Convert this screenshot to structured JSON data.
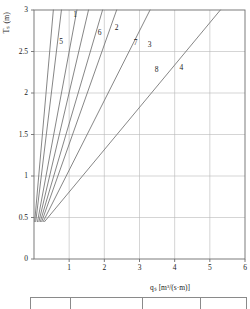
{
  "chart_data": {
    "type": "line",
    "title": "",
    "xlabel": "qₛ [m³/(s·m)]",
    "ylabel": "Tₛ (m)",
    "xlim": [
      0,
      6
    ],
    "ylim": [
      0,
      3
    ],
    "xticks": [
      "1",
      "2",
      "3",
      "4",
      "5",
      "6"
    ],
    "yticks": [
      "0",
      "0.5",
      "1",
      "1.5",
      "2",
      "2.5",
      "3"
    ],
    "grid": true,
    "legend": "inline-curve-labels",
    "series": [
      {
        "name": "5",
        "label": "5",
        "label_x": 0.8,
        "label_y": 2.62,
        "x": [
          0.02,
          0.55
        ],
        "y": [
          0.45,
          3.0
        ]
      },
      {
        "name": "1",
        "label": "1",
        "label_x": 1.2,
        "label_y": 2.94,
        "x": [
          0.05,
          0.78
        ],
        "y": [
          0.45,
          3.0
        ]
      },
      {
        "name": "6",
        "label": "6",
        "label_x": 1.9,
        "label_y": 2.72,
        "x": [
          0.1,
          1.22
        ],
        "y": [
          0.45,
          3.0
        ]
      },
      {
        "name": "2",
        "label": "2",
        "label_x": 2.38,
        "label_y": 2.78,
        "x": [
          0.14,
          1.55
        ],
        "y": [
          0.45,
          3.0
        ]
      },
      {
        "name": "7",
        "label": "7",
        "label_x": 2.92,
        "label_y": 2.6,
        "x": [
          0.18,
          1.95
        ],
        "y": [
          0.45,
          3.0
        ]
      },
      {
        "name": "3",
        "label": "3",
        "label_x": 3.32,
        "label_y": 2.58,
        "x": [
          0.22,
          2.35
        ],
        "y": [
          0.45,
          3.0
        ]
      },
      {
        "name": "8",
        "label": "8",
        "label_x": 3.52,
        "label_y": 2.28,
        "x": [
          0.26,
          3.3
        ],
        "y": [
          0.45,
          3.0
        ]
      },
      {
        "name": "4",
        "label": "4",
        "label_x": 4.22,
        "label_y": 2.3,
        "x": [
          0.3,
          5.3
        ],
        "y": [
          0.45,
          3.0
        ]
      }
    ]
  },
  "footer_table": {
    "columns": [
      "",
      "",
      "",
      ""
    ]
  }
}
